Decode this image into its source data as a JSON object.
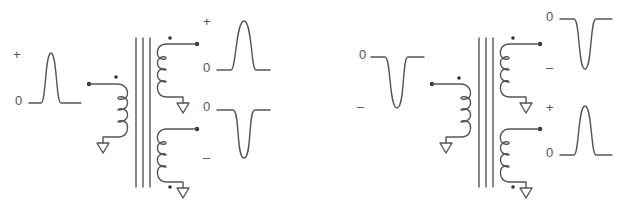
{
  "figure": {
    "left_circuit": {
      "input_pulse": {
        "polarity": "positive",
        "label_top": "+",
        "label_zero": "0"
      },
      "output_upper": {
        "polarity": "positive",
        "label_top": "+",
        "label_zero": "0"
      },
      "output_lower": {
        "polarity": "negative",
        "label_zero": "0",
        "label_bottom": "–"
      }
    },
    "right_circuit": {
      "input_pulse": {
        "polarity": "negative",
        "label_zero": "0",
        "label_bottom": "–"
      },
      "output_upper": {
        "polarity": "negative",
        "label_zero": "0",
        "label_bottom": "–"
      },
      "output_lower": {
        "polarity": "positive",
        "label_top": "+",
        "label_zero": "0"
      }
    }
  }
}
